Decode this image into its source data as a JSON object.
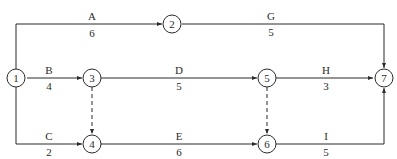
{
  "diagram": {
    "type": "activity-on-arrow network",
    "colors": {
      "line": "#2b2b2b",
      "background": "#ffffff"
    },
    "nodes": [
      {
        "id": "1",
        "label": "1"
      },
      {
        "id": "2",
        "label": "2"
      },
      {
        "id": "3",
        "label": "3"
      },
      {
        "id": "4",
        "label": "4"
      },
      {
        "id": "5",
        "label": "5"
      },
      {
        "id": "6",
        "label": "6"
      },
      {
        "id": "7",
        "label": "7"
      }
    ],
    "activities": [
      {
        "name": "A",
        "duration": "6",
        "from": "1",
        "to": "2"
      },
      {
        "name": "B",
        "duration": "4",
        "from": "1",
        "to": "3"
      },
      {
        "name": "C",
        "duration": "2",
        "from": "1",
        "to": "4"
      },
      {
        "name": "D",
        "duration": "5",
        "from": "3",
        "to": "5"
      },
      {
        "name": "E",
        "duration": "6",
        "from": "4",
        "to": "6"
      },
      {
        "name": "G",
        "duration": "5",
        "from": "2",
        "to": "7"
      },
      {
        "name": "H",
        "duration": "3",
        "from": "5",
        "to": "7"
      },
      {
        "name": "I",
        "duration": "5",
        "from": "6",
        "to": "7"
      }
    ],
    "dummy_activities": [
      {
        "from": "3",
        "to": "4"
      },
      {
        "from": "5",
        "to": "6"
      }
    ]
  }
}
